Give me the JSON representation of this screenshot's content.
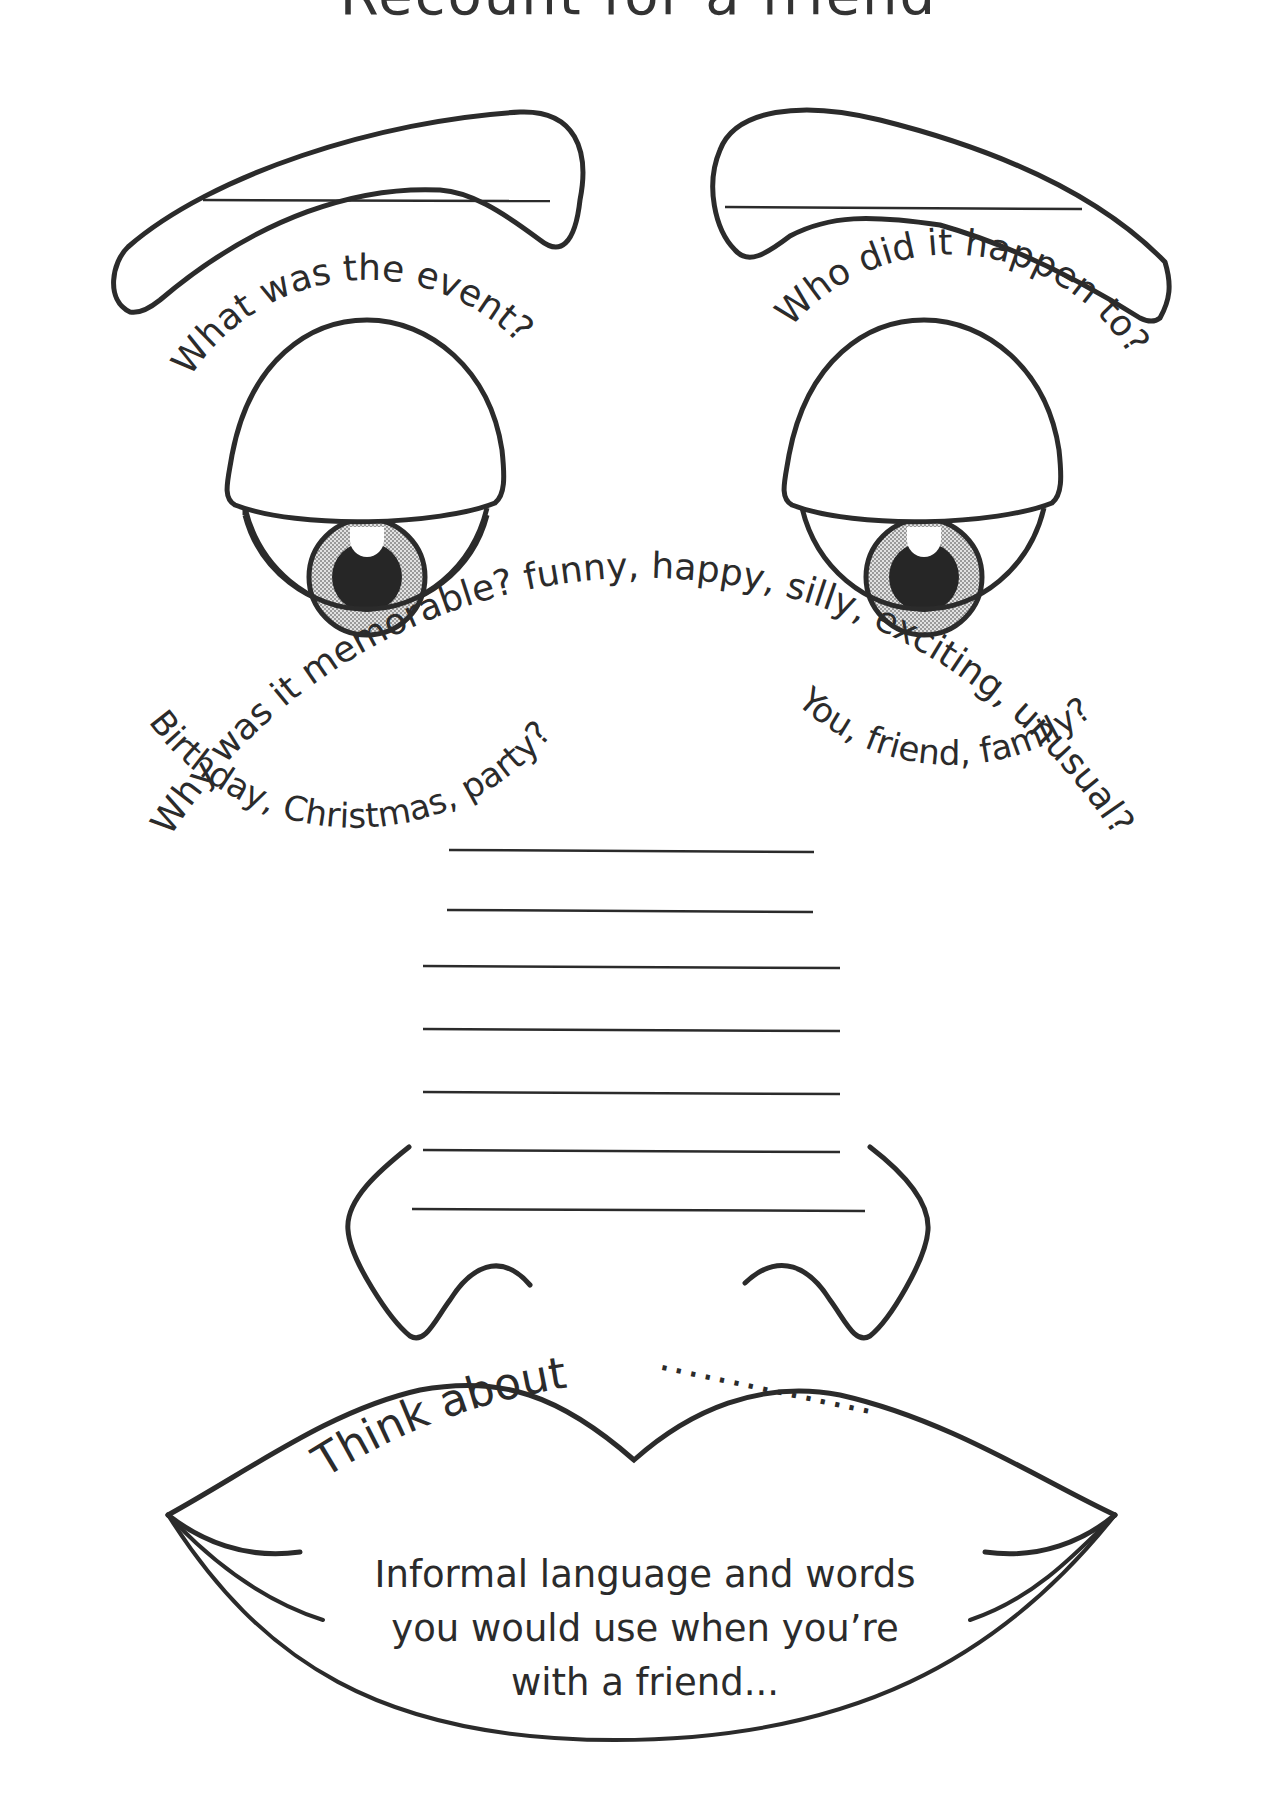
{
  "title": "Recount for a friend",
  "left_eyebrow": {
    "label": "event-answer-line",
    "value": ""
  },
  "right_eyebrow": {
    "label": "who-answer-line",
    "value": ""
  },
  "left_eye": {
    "question": "What was the event?",
    "hint": "Birthday, Christmas, party?"
  },
  "right_eye": {
    "question": "Who did it happen to?",
    "hint": "You, friend, family?"
  },
  "nose": {
    "question": "Why was it memorable? funny, happy, silly, exciting, unusual?",
    "answer_lines": 7
  },
  "mouth": {
    "prompt": "Think about",
    "dots": "...............",
    "lines": [
      "Informal language and words",
      "you would use when you’re",
      "with a friend..."
    ]
  },
  "colors": {
    "ink": "#2b2b2b",
    "iris_fill": "#c8c8c8",
    "pupil": "#262626",
    "paper": "#ffffff"
  }
}
